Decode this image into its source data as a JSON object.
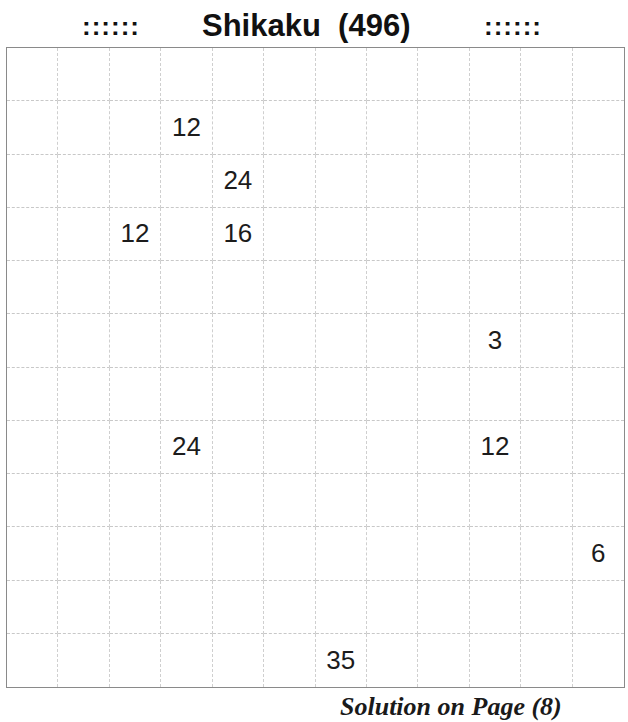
{
  "header": {
    "ornament_left": "::::::",
    "title": "Shikaku  (496)",
    "ornament_right": "::::::"
  },
  "puzzle": {
    "type": "Shikaku",
    "number": 496,
    "rows": 12,
    "cols": 12,
    "clues": [
      {
        "row": 1,
        "col": 3,
        "value": "12"
      },
      {
        "row": 2,
        "col": 4,
        "value": "24"
      },
      {
        "row": 3,
        "col": 2,
        "value": "12"
      },
      {
        "row": 3,
        "col": 4,
        "value": "16"
      },
      {
        "row": 5,
        "col": 9,
        "value": "3"
      },
      {
        "row": 7,
        "col": 3,
        "value": "24"
      },
      {
        "row": 7,
        "col": 9,
        "value": "12"
      },
      {
        "row": 9,
        "col": 11,
        "value": "6"
      },
      {
        "row": 11,
        "col": 6,
        "value": "35"
      }
    ]
  },
  "footer": {
    "text": "Solution on Page (8)"
  },
  "colors": {
    "grid_line": "#c8c8c8",
    "grid_border": "#8a8a8a",
    "text": "#1c1c1c",
    "background": "#ffffff"
  }
}
